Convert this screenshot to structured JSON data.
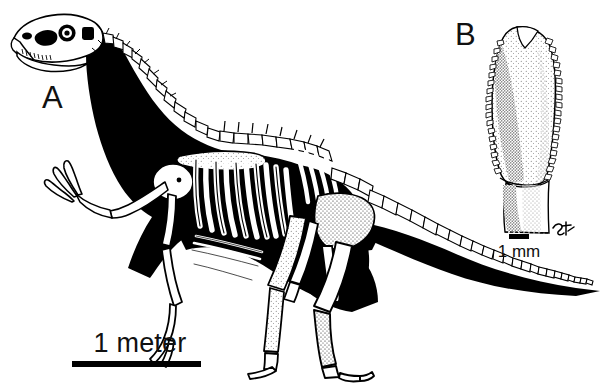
{
  "figure": {
    "kind": "scientific-figure",
    "background_color": "#ffffff",
    "ink_color": "#000000",
    "width": 607,
    "height": 384
  },
  "panels": [
    {
      "id": "A",
      "label": "A",
      "subject": "theropod-skeleton-lateral-view",
      "orientation": "facing-left",
      "fill_style": "black body silhouette with white bone outlines",
      "parts": [
        "skull",
        "antorbital-fenestra",
        "orbit",
        "infratemporal-fenestra",
        "lower-jaw",
        "cervical-vertebrae",
        "dorsal-vertebrae",
        "scapula",
        "ribcage",
        "gastralia",
        "forelimb",
        "manual-claws",
        "pelvis",
        "ilium",
        "pubis",
        "ischium",
        "femur",
        "tibia",
        "metatarsus",
        "pes",
        "caudal-vertebrae",
        "tail"
      ],
      "scale": {
        "label": "1 meter",
        "bar_length_px": 129,
        "unit": "meter",
        "value": 1
      }
    },
    {
      "id": "B",
      "label": "B",
      "subject": "isolated-tooth",
      "orientation": "crown-up",
      "fill_style": "stippled shading with outlined denticles on both carinae",
      "parts": [
        "tooth-crown",
        "anterior-carina-denticles",
        "posterior-carina-denticles",
        "crown-base",
        "root",
        "artist-monogram"
      ],
      "scale": {
        "label": "1 mm",
        "bar_length_px": 20,
        "unit": "mm",
        "value": 1
      }
    }
  ],
  "labels": {
    "panel_a": "A",
    "panel_b": "B",
    "scale_meter": "1 meter",
    "scale_mm": "1 mm"
  }
}
